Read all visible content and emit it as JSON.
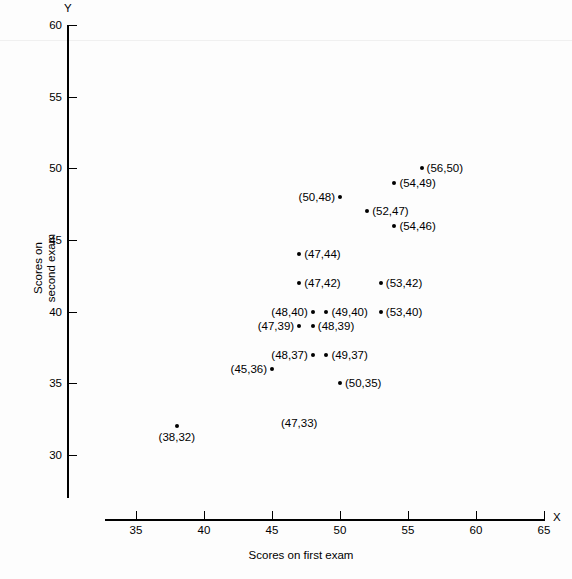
{
  "chart_data": {
    "type": "scatter",
    "title": "",
    "xlabel": "Scores on first exam",
    "ylabel": "Scores on second exam",
    "x_axis_name": "X",
    "y_axis_name": "Y",
    "xlim": [
      33,
      65
    ],
    "ylim": [
      28,
      60
    ],
    "xticks": [
      35,
      40,
      45,
      50,
      55,
      60,
      65
    ],
    "yticks": [
      30,
      35,
      40,
      45,
      50,
      55,
      60
    ],
    "xtick_labels": [
      "35",
      "40",
      "45",
      "50",
      "55",
      "60",
      "65"
    ],
    "ytick_labels": [
      "30",
      "35",
      "40",
      "45",
      "50",
      "55",
      "60"
    ],
    "grid": false,
    "legend": false,
    "points": [
      {
        "x": 56,
        "y": 50,
        "label": "(56,50)",
        "label_pos": "right",
        "marker": true
      },
      {
        "x": 54,
        "y": 49,
        "label": "(54,49)",
        "label_pos": "right",
        "marker": true
      },
      {
        "x": 50,
        "y": 48,
        "label": "(50,48)",
        "label_pos": "left",
        "marker": true
      },
      {
        "x": 52,
        "y": 47,
        "label": "(52,47)",
        "label_pos": "right",
        "marker": true
      },
      {
        "x": 54,
        "y": 46,
        "label": "(54,46)",
        "label_pos": "right",
        "marker": true
      },
      {
        "x": 47,
        "y": 44,
        "label": "(47,44)",
        "label_pos": "right",
        "marker": true
      },
      {
        "x": 47,
        "y": 42,
        "label": "(47,42)",
        "label_pos": "right",
        "marker": true
      },
      {
        "x": 53,
        "y": 42,
        "label": "(53,42)",
        "label_pos": "right",
        "marker": true
      },
      {
        "x": 48,
        "y": 40,
        "label": "(48,40)",
        "label_pos": "left",
        "marker": true
      },
      {
        "x": 49,
        "y": 40,
        "label": "(49,40)",
        "label_pos": "right",
        "marker": true
      },
      {
        "x": 53,
        "y": 40,
        "label": "(53,40)",
        "label_pos": "right",
        "marker": true
      },
      {
        "x": 47,
        "y": 39,
        "label": "(47,39)",
        "label_pos": "left",
        "marker": true
      },
      {
        "x": 48,
        "y": 39,
        "label": "(48,39)",
        "label_pos": "right",
        "marker": true
      },
      {
        "x": 48,
        "y": 37,
        "label": "(48,37)",
        "label_pos": "left",
        "marker": true
      },
      {
        "x": 49,
        "y": 37,
        "label": "(49,37)",
        "label_pos": "right",
        "marker": true
      },
      {
        "x": 45,
        "y": 36,
        "label": "(45,36)",
        "label_pos": "left",
        "marker": true
      },
      {
        "x": 50,
        "y": 35,
        "label": "(50,35)",
        "label_pos": "right",
        "marker": true
      },
      {
        "x": 47,
        "y": 33,
        "label": "(47,33)",
        "label_pos": "below",
        "marker": false
      },
      {
        "x": 38,
        "y": 32,
        "label": "(38,32)",
        "label_pos": "below",
        "marker": true
      }
    ]
  }
}
